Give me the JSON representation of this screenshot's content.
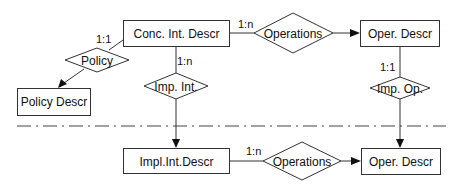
{
  "diagram": {
    "entities": {
      "conc_int_descr": "Conc. Int. Descr",
      "policy_descr": "Policy Descr",
      "oper_descr_top": "Oper. Descr",
      "impl_int_descr": "Impl.Int.Descr",
      "oper_descr_bottom": "Oper. Descr"
    },
    "relations": {
      "policy": "Policy",
      "imp_int": "Imp. Int.",
      "operations_top": "Operations",
      "imp_op": "Imp. Op.",
      "operations_bottom": "Operations"
    },
    "cardinalities": {
      "policy": "1:1",
      "imp_int": "1:n",
      "operations_top": "1:n",
      "imp_op": "1:1",
      "operations_bottom": "1:n"
    }
  }
}
